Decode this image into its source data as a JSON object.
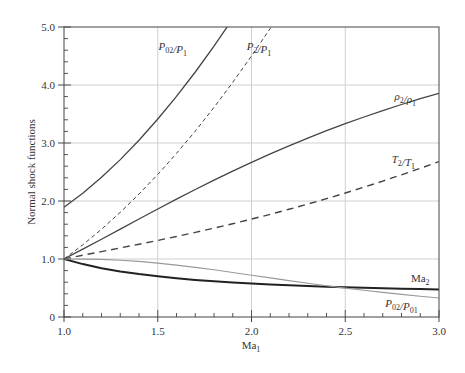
{
  "chart_data": {
    "type": "line",
    "title": "",
    "xlabel": "Ma1",
    "xlabel_base": "Ma",
    "xlabel_sub": "1",
    "ylabel": "Normal shock functions",
    "xlim": [
      1.0,
      3.0
    ],
    "ylim": [
      0,
      5.0
    ],
    "grid": true,
    "legend": "inline curve labels",
    "x_ticks": [
      1.0,
      1.5,
      2.0,
      2.5,
      3.0
    ],
    "x_tick_labels": [
      "1.0",
      "1.5",
      "2.0",
      "2.5",
      "3.0"
    ],
    "x_minor_step": 0.1,
    "y_ticks": [
      0,
      1.0,
      2.0,
      3.0,
      4.0,
      5.0
    ],
    "y_tick_labels": [
      "0",
      "1.0",
      "2.0",
      "3.0",
      "4.0",
      "5.0"
    ],
    "y_minor_step": 0.2,
    "x": [
      1.0,
      1.1,
      1.2,
      1.3,
      1.4,
      1.5,
      1.6,
      1.7,
      1.8,
      1.9,
      2.0,
      2.1,
      2.2,
      2.3,
      2.4,
      2.5,
      2.6,
      2.7,
      2.8,
      2.9,
      3.0
    ],
    "series": [
      {
        "name": "P02/P1",
        "label_parts": [
          [
            "P",
            "02"
          ],
          [
            "/P",
            "1"
          ]
        ],
        "style": "solid",
        "values": [
          1.893,
          2.133,
          2.408,
          2.714,
          3.049,
          3.413,
          3.805,
          4.224,
          4.67,
          5.142,
          5.64,
          null,
          null,
          null,
          null,
          null,
          null,
          null,
          null,
          null,
          null
        ]
      },
      {
        "name": "P2/P1",
        "label_parts": [
          [
            "P",
            "2"
          ],
          [
            "/P",
            "1"
          ]
        ],
        "style": "dashed-fine",
        "values": [
          1.0,
          1.245,
          1.513,
          1.805,
          2.12,
          2.458,
          2.82,
          3.205,
          3.613,
          4.045,
          4.5,
          4.978,
          5.48,
          null,
          null,
          null,
          null,
          null,
          null,
          null,
          null
        ]
      },
      {
        "name": "ρ2/ρ1",
        "label_parts": [
          [
            "ρ",
            "2"
          ],
          [
            "/ρ",
            "1"
          ]
        ],
        "style": "solid",
        "values": [
          1.0,
          1.169,
          1.342,
          1.516,
          1.69,
          1.862,
          2.032,
          2.198,
          2.359,
          2.516,
          2.667,
          2.812,
          2.951,
          3.085,
          3.212,
          3.333,
          3.449,
          3.559,
          3.664,
          3.763,
          3.857
        ]
      },
      {
        "name": "T2/T1",
        "label_parts": [
          [
            "T",
            "2"
          ],
          [
            "/T",
            "1"
          ]
        ],
        "style": "dashed",
        "values": [
          1.0,
          1.065,
          1.128,
          1.191,
          1.255,
          1.32,
          1.388,
          1.458,
          1.532,
          1.608,
          1.688,
          1.77,
          1.857,
          1.947,
          2.04,
          2.138,
          2.238,
          2.343,
          2.451,
          2.563,
          2.679
        ]
      },
      {
        "name": "Ma2",
        "label_parts": [
          [
            "Ma",
            "2"
          ]
        ],
        "style": "solid-thick",
        "values": [
          1.0,
          0.912,
          0.842,
          0.786,
          0.74,
          0.701,
          0.668,
          0.64,
          0.616,
          0.595,
          0.577,
          0.561,
          0.547,
          0.534,
          0.523,
          0.513,
          0.504,
          0.496,
          0.488,
          0.481,
          0.475
        ]
      },
      {
        "name": "P02/P01",
        "label_parts": [
          [
            "P",
            "02"
          ],
          [
            "/P",
            "01"
          ]
        ],
        "style": "solid-light",
        "values": [
          1.0,
          0.999,
          0.993,
          0.979,
          0.958,
          0.93,
          0.895,
          0.856,
          0.813,
          0.767,
          0.721,
          0.674,
          0.628,
          0.583,
          0.54,
          0.499,
          0.46,
          0.424,
          0.389,
          0.358,
          0.328
        ]
      }
    ],
    "annotations": [
      {
        "text": "P02/P1",
        "at_x": 1.58,
        "at_y": 4.6
      },
      {
        "text": "P2/P1",
        "at_x": 2.04,
        "at_y": 4.6
      },
      {
        "text": "ρ2/ρ1",
        "at_x": 2.82,
        "at_y": 3.75
      },
      {
        "text": "T2/T1",
        "at_x": 2.81,
        "at_y": 2.65
      },
      {
        "text": "Ma2",
        "at_x": 2.9,
        "at_y": 0.6
      },
      {
        "text": "P02/P01",
        "at_x": 2.8,
        "at_y": 0.18
      }
    ]
  }
}
